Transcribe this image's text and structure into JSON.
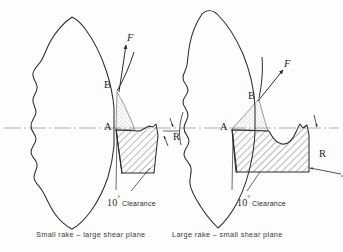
{
  "figure": {
    "background_color": "#fdfdfd",
    "ink_color": "#2b2b2b",
    "centerline_color": "#9a9a9a",
    "hatch_color": "#3a3a3a",
    "stipple_color": "#6e6e6e"
  },
  "panels": [
    {
      "id": "left",
      "caption": "Small rake – large shear plane",
      "labels": {
        "point_a": "A",
        "point_b": "B",
        "force": "F",
        "radius": "R",
        "clearance_value": "10",
        "clearance_degree": "°",
        "clearance_text": "Clearance"
      }
    },
    {
      "id": "right",
      "caption": "Large rake – small shear plane",
      "labels": {
        "point_a": "A",
        "point_b": "B",
        "force": "F",
        "radius": "R",
        "clearance_value": "10",
        "clearance_degree": "°",
        "clearance_text": "Clearance"
      }
    }
  ]
}
